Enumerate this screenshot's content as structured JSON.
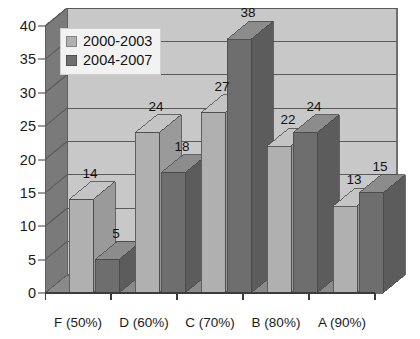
{
  "chart_data": {
    "type": "bar",
    "title": "",
    "subtitle": "",
    "xlabel": "",
    "ylabel": "",
    "categories": [
      "F (50%)",
      "D (60%)",
      "C (70%)",
      "B (80%)",
      "A (90%)"
    ],
    "series": [
      {
        "name": "2000-2003",
        "color": "#b0b0b0",
        "values": [
          14,
          24,
          27,
          22,
          13
        ]
      },
      {
        "name": "2004-2007",
        "color": "#6e6e6e",
        "values": [
          5,
          18,
          38,
          24,
          15
        ]
      }
    ],
    "ylim": [
      0,
      40
    ],
    "yticks": [
      0,
      5,
      10,
      15,
      20,
      25,
      30,
      35,
      40
    ],
    "ytick_labels": [
      "0",
      "5",
      "10",
      "15",
      "20",
      "25",
      "30",
      "35",
      "40"
    ],
    "grid": true,
    "grid_axis": "y",
    "legend_position": "upper-left-inside",
    "style": "3d-column",
    "data_labels": true,
    "plot_background": "#c8c8c8",
    "wall_color": "#7a7a7a",
    "floor_color": "#8a8a8a",
    "gridline_color": "#5a5a5a",
    "axis_color": "#3b3b3b",
    "text_color": "#1b1b1b"
  },
  "legend": {
    "items": [
      {
        "label": "2000-2003"
      },
      {
        "label": "2004-2007"
      }
    ]
  }
}
